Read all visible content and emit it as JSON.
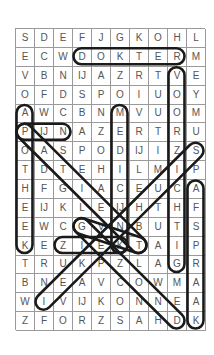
{
  "puzzle": {
    "columns": 10,
    "rows": 16,
    "grid": [
      [
        "S",
        "D",
        "E",
        "F",
        "J",
        "G",
        "K",
        "O",
        "H",
        "L"
      ],
      [
        "E",
        "C",
        "W",
        "D",
        "O",
        "K",
        "T",
        "E",
        "R",
        "M"
      ],
      [
        "V",
        "B",
        "N",
        "IJ",
        "A",
        "Z",
        "R",
        "T",
        "V",
        "E"
      ],
      [
        "O",
        "F",
        "D",
        "S",
        "P",
        "O",
        "I",
        "U",
        "O",
        "Y"
      ],
      [
        "A",
        "W",
        "C",
        "B",
        "N",
        "M",
        "V",
        "U",
        "O",
        "M"
      ],
      [
        "P",
        "IJ",
        "N",
        "A",
        "Z",
        "E",
        "R",
        "T",
        "R",
        "U"
      ],
      [
        "O",
        "A",
        "S",
        "P",
        "O",
        "D",
        "IJ",
        "I",
        "Z",
        "S"
      ],
      [
        "T",
        "D",
        "T",
        "E",
        "H",
        "I",
        "L",
        "M",
        "I",
        "P"
      ],
      [
        "H",
        "F",
        "G",
        "I",
        "A",
        "C",
        "E",
        "U",
        "C",
        "A"
      ],
      [
        "E",
        "IJ",
        "K",
        "L",
        "E",
        "IJ",
        "H",
        "T",
        "H",
        "F"
      ],
      [
        "E",
        "W",
        "C",
        "G",
        "V",
        "N",
        "B",
        "U",
        "T",
        "S"
      ],
      [
        "K",
        "E",
        "Z",
        "I",
        "E",
        "K",
        "T",
        "A",
        "I",
        "P"
      ],
      [
        "T",
        "R",
        "U",
        "K",
        "P",
        "Z",
        "L",
        "A",
        "G",
        "R"
      ],
      [
        "B",
        "N",
        "E",
        "A",
        "V",
        "C",
        "O",
        "W",
        "M",
        "A"
      ],
      [
        "W",
        "I",
        "V",
        "IJ",
        "K",
        "O",
        "N",
        "N",
        "E",
        "A"
      ],
      [
        "Z",
        "F",
        "O",
        "R",
        "Z",
        "S",
        "A",
        "H",
        "D",
        "K"
      ]
    ],
    "found_words": [
      {
        "word": "DOKTER",
        "start": [
          1,
          3
        ],
        "end": [
          1,
          8
        ]
      },
      {
        "word": "VOORZIGTIG",
        "start": [
          2,
          8
        ],
        "end": [
          12,
          8
        ]
      },
      {
        "word": "APOTHEEK",
        "start": [
          4,
          0
        ],
        "end": [
          11,
          0
        ]
      },
      {
        "word": "MEDICIJN",
        "start": [
          4,
          5
        ],
        "end": [
          11,
          5
        ]
      },
      {
        "word": "PIJN",
        "start": [
          5,
          0
        ],
        "end": [
          5,
          2
        ]
      },
      {
        "word": "PATIENT",
        "start": [
          5,
          0
        ],
        "end": [
          11,
          6
        ]
      },
      {
        "word": "SZIEKENHUIS",
        "start": [
          6,
          9
        ],
        "end": [
          14,
          1
        ]
      },
      {
        "word": "AFSPRAAK",
        "start": [
          8,
          9
        ],
        "end": [
          15,
          9
        ]
      },
      {
        "word": "GEZOND",
        "start": [
          10,
          3
        ],
        "end": [
          15,
          8
        ]
      },
      {
        "word": "ZIEK",
        "start": [
          11,
          2
        ],
        "end": [
          11,
          5
        ]
      },
      {
        "word": "GENEZEN",
        "start": [
          10,
          3
        ],
        "end": [
          11,
          6
        ]
      }
    ],
    "colors": {
      "loop": "#1a1a1a",
      "grid_line": "#9a9a9a",
      "letter": "#555555"
    }
  }
}
